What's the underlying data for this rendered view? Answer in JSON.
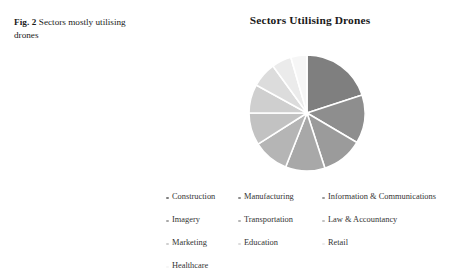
{
  "figure": {
    "label": "Fig. 2",
    "caption": "Sectors mostly utilising drones"
  },
  "chart_data": {
    "type": "pie",
    "title": "Sectors Utilising Drones",
    "xlabel": "",
    "ylabel": "",
    "legend_position": "bottom",
    "legend_columns": 3,
    "start_angle": 0,
    "direction": "clockwise",
    "categories": [
      "Construction",
      "Manufacturing",
      "Information & Communications",
      "Imagery",
      "Transportation",
      "Law & Accountancy",
      "Marketing",
      "Education",
      "Retail",
      "Healthcare"
    ],
    "values": [
      20.0,
      13.5,
      11.5,
      11.0,
      10.0,
      9.0,
      8.0,
      7.0,
      5.5,
      4.5
    ],
    "units": "percent",
    "colors": [
      "#7f7f7f",
      "#8e8e8e",
      "#9b9b9b",
      "#a8a8a8",
      "#b5b5b5",
      "#c2c2c2",
      "#cfcfcf",
      "#dcdcdc",
      "#ebebeb",
      "#f6f6f6"
    ],
    "slice_gap_color": "#ffffff"
  },
  "legend": {
    "items": [
      {
        "label": "Construction",
        "color": "#7f7f7f"
      },
      {
        "label": "Manufacturing",
        "color": "#8e8e8e"
      },
      {
        "label": "Information & Communications",
        "color": "#9b9b9b"
      },
      {
        "label": "Imagery",
        "color": "#a8a8a8"
      },
      {
        "label": "Transportation",
        "color": "#b5b5b5"
      },
      {
        "label": "Law & Accountancy",
        "color": "#c2c2c2"
      },
      {
        "label": "Marketing",
        "color": "#cfcfcf"
      },
      {
        "label": "Education",
        "color": "#dcdcdc"
      },
      {
        "label": "Retail",
        "color": "#ebebeb"
      },
      {
        "label": "Healthcare",
        "color": "#f6f6f6"
      }
    ]
  }
}
